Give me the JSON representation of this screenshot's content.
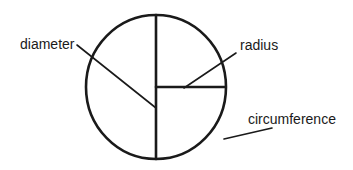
{
  "diagram": {
    "labels": {
      "diameter": "diameter",
      "radius": "radius",
      "circumference": "circumference"
    },
    "colors": {
      "stroke": "#1a1a1a",
      "background": "#ffffff"
    }
  }
}
